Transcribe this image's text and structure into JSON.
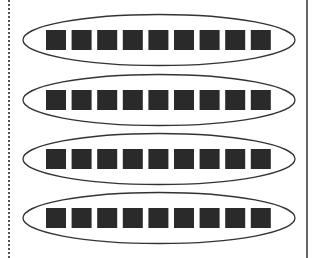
{
  "diagram": {
    "colors": {
      "background": "#ffffff",
      "square_fill": "#2a2a2a",
      "ellipse_stroke": "#333333",
      "left_border": "#555555",
      "right_border": "#333333"
    },
    "left_border": {
      "style": "dotted",
      "x": 9
    },
    "right_border": {
      "style": "solid",
      "x": 307
    },
    "groups": [
      {
        "label": "group-1",
        "count": 9,
        "cy": 40
      },
      {
        "label": "group-2",
        "count": 9,
        "cy": 100
      },
      {
        "label": "group-3",
        "count": 9,
        "cy": 159
      },
      {
        "label": "group-4",
        "count": 9,
        "cy": 218
      }
    ],
    "ellipse": {
      "cx": 159,
      "rx": 136,
      "ry": 25.5
    },
    "square": {
      "size": 20,
      "start_x": 46,
      "step": 25.6
    }
  }
}
